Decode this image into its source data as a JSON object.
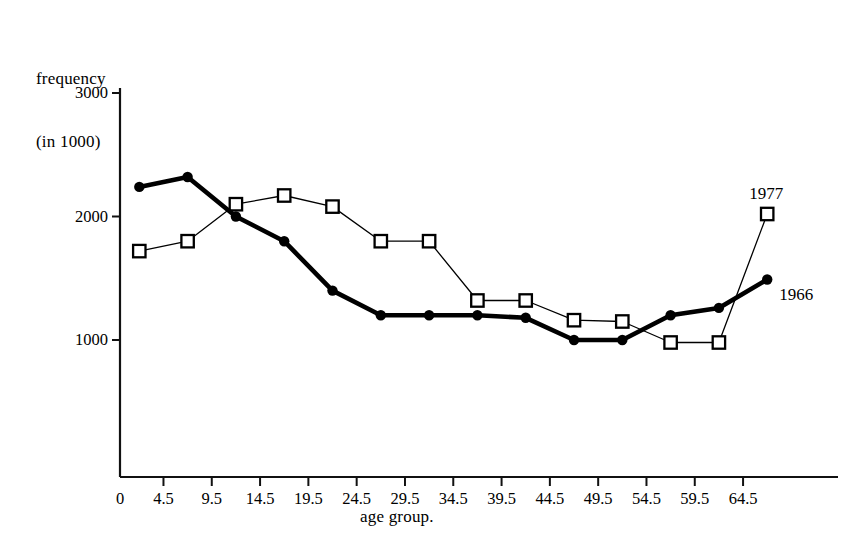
{
  "chart_data": {
    "type": "line",
    "title": "",
    "ylabel": "frequency\n(in 1000)",
    "ylabel_line1": "frequency",
    "ylabel_line2": "(in 1000)",
    "xlabel": "age group.",
    "x_tick_labels": [
      "0",
      "4.5",
      "9.5",
      "14.5",
      "19.5",
      "24.5",
      "29.5",
      "34.5",
      "39.5",
      "44.5",
      "49.5",
      "54.5",
      "59.5",
      "64.5"
    ],
    "x_tick_values": [
      0,
      4.5,
      9.5,
      14.5,
      19.5,
      24.5,
      29.5,
      34.5,
      39.5,
      44.5,
      49.5,
      54.5,
      59.5,
      64.5
    ],
    "y_tick_labels": [
      "1000",
      "2000",
      "3000"
    ],
    "y_tick_values": [
      1000,
      2000,
      3000
    ],
    "ylim": [
      0,
      3200
    ],
    "xlim": [
      -2.5,
      69.5
    ],
    "grid": false,
    "legend_position": "inline-end-of-line",
    "categories": [
      "0-4",
      "5-9",
      "10-14",
      "15-19",
      "20-24",
      "25-29",
      "30-34",
      "35-39",
      "40-44",
      "45-49",
      "50-54",
      "55-59",
      "60-64",
      "65+"
    ],
    "x": [
      2,
      7,
      12,
      17,
      22,
      27,
      32,
      37,
      42,
      47,
      52,
      57,
      62,
      67
    ],
    "series": [
      {
        "name": "1966",
        "marker": "filled-circle",
        "line_weight": "thick",
        "values": [
          2240,
          2320,
          2000,
          1800,
          1400,
          1200,
          1200,
          1200,
          1180,
          1000,
          1000,
          1200,
          1260,
          1490
        ]
      },
      {
        "name": "1977",
        "marker": "open-square",
        "line_weight": "thin",
        "values": [
          1720,
          1800,
          2100,
          2170,
          2080,
          1800,
          1800,
          1320,
          1320,
          1160,
          1150,
          980,
          980,
          2020
        ]
      }
    ],
    "annotations": [
      {
        "text": "1977",
        "series": "1977",
        "at_x": 67,
        "at_y": 2020
      },
      {
        "text": "1966",
        "series": "1966",
        "at_x": 67,
        "at_y": 1490
      }
    ]
  },
  "style": {
    "axis_color": "#111111",
    "series_1966_color": "#000000",
    "series_1977_color": "#000000",
    "background": "#ffffff"
  }
}
